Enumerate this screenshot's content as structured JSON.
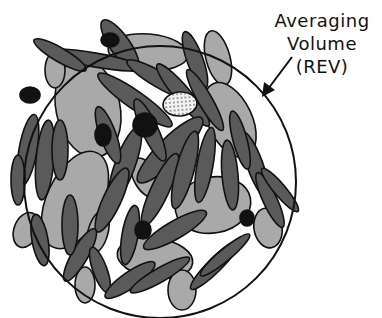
{
  "diagram": {
    "label_lines": [
      "Averaging",
      "Volume",
      "(REV)"
    ],
    "elements": {
      "circle": {
        "cx": 160,
        "cy": 182,
        "r": 136,
        "stroke": "#111111"
      },
      "arrow": {
        "from": [
          292,
          57
        ],
        "to": [
          262,
          97
        ]
      }
    },
    "colors": {
      "dark_grains": "#5a5a5a",
      "light_grains": "#a9a9a9",
      "black_inclusions": "#111111",
      "dotted_grain": "#f0f0f0",
      "outline": "#111111",
      "background": "#ffffff"
    }
  }
}
